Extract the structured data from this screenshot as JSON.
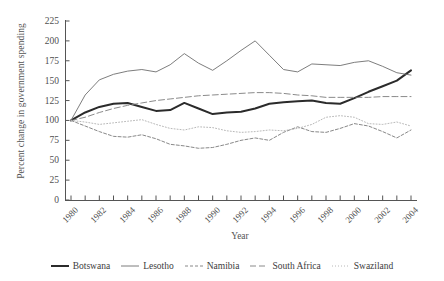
{
  "chart_data": {
    "type": "line",
    "title": "",
    "xlabel": "Year",
    "ylabel": "Percent change in government spending",
    "xlim": [
      1980,
      2004
    ],
    "ylim": [
      0,
      225
    ],
    "ytick_labels": [
      "225",
      "200",
      "175",
      "150",
      "125",
      "100",
      "75",
      "50",
      "25",
      "0"
    ],
    "yticks": [
      225,
      200,
      175,
      150,
      125,
      100,
      75,
      50,
      25,
      0
    ],
    "xtick_labels": [
      "1980",
      "1982",
      "1984",
      "1986",
      "1988",
      "1990",
      "1992",
      "1994",
      "1996",
      "1998",
      "2000",
      "2002",
      "2004"
    ],
    "xticks": [
      1980,
      1982,
      1984,
      1986,
      1988,
      1990,
      1992,
      1994,
      1996,
      1998,
      2000,
      2002,
      2004
    ],
    "x": [
      1980,
      1981,
      1982,
      1983,
      1984,
      1985,
      1986,
      1987,
      1988,
      1989,
      1990,
      1991,
      1992,
      1993,
      1994,
      1995,
      1996,
      1997,
      1998,
      1999,
      2000,
      2001,
      2002,
      2003,
      2004
    ],
    "grid": false,
    "legend_position": "below",
    "series": [
      {
        "name": "Botswana",
        "style": "solid-thick",
        "color": "#2b2b2b",
        "values": [
          100,
          110,
          117,
          121,
          122,
          117,
          112,
          113,
          122,
          115,
          108,
          110,
          111,
          115,
          121,
          123,
          124,
          125,
          122,
          121,
          128,
          136,
          143,
          150,
          163
        ]
      },
      {
        "name": "Lesotho",
        "style": "solid-thin",
        "color": "#6e6e6e",
        "values": [
          100,
          132,
          151,
          158,
          162,
          164,
          161,
          170,
          184,
          172,
          163,
          175,
          188,
          200,
          182,
          164,
          161,
          171,
          170,
          169,
          173,
          175,
          168,
          160,
          157
        ]
      },
      {
        "name": "Namibia",
        "style": "dash-dot",
        "color": "#7a7a7a",
        "values": [
          100,
          93,
          86,
          80,
          79,
          82,
          77,
          70,
          68,
          65,
          66,
          70,
          75,
          78,
          75,
          85,
          92,
          86,
          85,
          90,
          96,
          93,
          86,
          78,
          88
        ]
      },
      {
        "name": "South Africa",
        "style": "dashed",
        "color": "#7d7d7d",
        "values": [
          100,
          104,
          110,
          115,
          119,
          122,
          125,
          127,
          129,
          131,
          132,
          133,
          134,
          135,
          135,
          134,
          132,
          131,
          129,
          129,
          129,
          129,
          130,
          130,
          130
        ]
      },
      {
        "name": "Swaziland",
        "style": "dotted",
        "color": "#b0b0b0",
        "values": [
          100,
          98,
          95,
          97,
          99,
          101,
          95,
          90,
          88,
          92,
          91,
          87,
          85,
          86,
          88,
          87,
          90,
          95,
          104,
          106,
          104,
          96,
          95,
          98,
          93
        ]
      }
    ]
  }
}
